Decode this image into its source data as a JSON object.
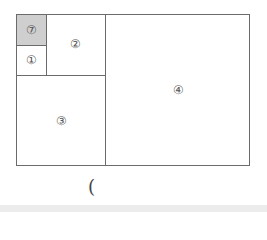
{
  "diagram": {
    "regions": [
      {
        "id": "r7",
        "label": "⑦",
        "fill": "#cfcfcf"
      },
      {
        "id": "r1",
        "label": "①"
      },
      {
        "id": "r2",
        "label": "②"
      },
      {
        "id": "r3",
        "label": "③"
      },
      {
        "id": "r4",
        "label": "④"
      }
    ],
    "answer_paren": "("
  }
}
